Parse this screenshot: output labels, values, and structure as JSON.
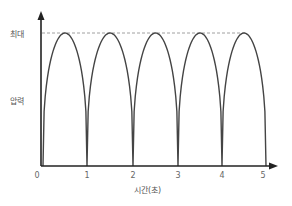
{
  "chart_data": {
    "type": "line",
    "title": "",
    "xlabel": "시간(초)",
    "ylabel": "압력",
    "y_max_label": "최대",
    "x_ticks": [
      "0",
      "1",
      "2",
      "3",
      "4",
      "5"
    ],
    "xlim": [
      0,
      5
    ],
    "ylim": [
      0,
      1
    ],
    "grid": false,
    "legend": null,
    "series": [
      {
        "name": "압력",
        "description": "periodic pulse, 1 cycle per second, minimum 0 at integer seconds, peak at maximum (dashed line) at x.5",
        "x": [
          0,
          0.5,
          1,
          1.5,
          2,
          2.5,
          3,
          3.5,
          4,
          4.5,
          5
        ],
        "values": [
          0,
          1,
          0,
          1,
          0,
          1,
          0,
          1,
          0,
          1,
          0
        ]
      }
    ],
    "annotations": [
      {
        "type": "dashed-hline",
        "y": 1,
        "label": "최대"
      }
    ]
  }
}
